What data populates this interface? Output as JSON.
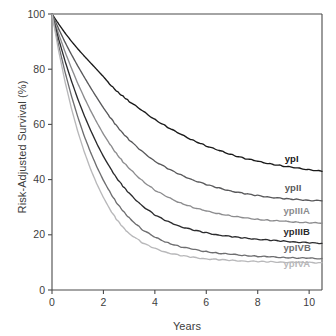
{
  "chart_data": {
    "type": "line",
    "title": "",
    "subtitle": "",
    "xlabel": "Years",
    "ylabel": "Risk-Adjusted Survival (%)",
    "xlim": [
      0,
      10.5
    ],
    "ylim": [
      0,
      100
    ],
    "xticks": [
      "0",
      "2",
      "4",
      "6",
      "8",
      "10"
    ],
    "xtick_values": [
      0,
      2,
      4,
      6,
      8,
      10
    ],
    "yticks": [
      "0",
      "20",
      "40",
      "60",
      "80",
      "100"
    ],
    "ytick_values": [
      0,
      20,
      40,
      60,
      80,
      100
    ],
    "grid": false,
    "legend_position": "inline-right-of-curve-ends",
    "x": [
      0,
      0.25,
      0.5,
      0.75,
      1,
      1.25,
      1.5,
      1.75,
      2,
      2.25,
      2.5,
      2.75,
      3,
      3.5,
      4,
      4.5,
      5,
      5.5,
      6,
      6.5,
      7,
      7.5,
      8,
      8.5,
      9,
      9.5,
      10,
      10.5
    ],
    "series": [
      {
        "name": "ypI",
        "color": "#1a1a1a",
        "label": "ypI",
        "label_x": 9.05,
        "label_y": 46.5,
        "final_value": 43,
        "values": [
          100,
          96.5,
          93.2,
          90.2,
          87.4,
          84.8,
          82.3,
          79.8,
          77.3,
          74.6,
          72.1,
          70.3,
          68.4,
          65.0,
          61.8,
          59.0,
          56.4,
          54.2,
          52.2,
          50.5,
          49.0,
          47.7,
          46.6,
          45.7,
          44.9,
          44.2,
          43.6,
          43.0
        ]
      },
      {
        "name": "ypII",
        "color": "#59595b",
        "label": "ypII",
        "label_x": 9.05,
        "label_y": 35.8,
        "final_value": 32.3,
        "values": [
          100,
          94.8,
          89.9,
          85.4,
          81.2,
          77.2,
          73.3,
          69.6,
          66.0,
          62.7,
          59.6,
          56.9,
          54.4,
          50.2,
          46.7,
          44.0,
          41.7,
          39.8,
          38.2,
          36.9,
          35.8,
          34.9,
          34.2,
          33.6,
          33.1,
          32.8,
          32.5,
          32.3
        ]
      },
      {
        "name": "ypIIIA",
        "color": "#8c8c8e",
        "label": "ypIIIA",
        "label_x": 9.0,
        "label_y": 27.6,
        "final_value": 24.2,
        "values": [
          100,
          93.0,
          86.5,
          80.5,
          74.9,
          69.8,
          65.0,
          60.6,
          56.5,
          52.8,
          49.5,
          46.6,
          44.0,
          39.7,
          36.2,
          33.6,
          31.5,
          29.9,
          28.6,
          27.6,
          26.8,
          26.1,
          25.6,
          25.2,
          24.9,
          24.6,
          24.4,
          24.2
        ]
      },
      {
        "name": "ypIIIB",
        "color": "#2b2b2d",
        "label": "ypIIIB",
        "label_x": 9.0,
        "label_y": 19.8,
        "final_value": 16.9,
        "values": [
          100,
          91.2,
          83.2,
          75.9,
          69.3,
          63.3,
          57.9,
          52.9,
          48.4,
          44.4,
          40.8,
          37.7,
          35.0,
          30.6,
          27.2,
          24.8,
          23.0,
          21.7,
          20.7,
          19.9,
          19.3,
          18.8,
          18.4,
          18.0,
          17.7,
          17.4,
          17.1,
          16.9
        ]
      },
      {
        "name": "ypIVB",
        "color": "#6e6e70",
        "label": "ypIVB",
        "label_x": 9.0,
        "label_y": 14.2,
        "final_value": 11.4,
        "values": [
          100,
          89.0,
          79.2,
          70.5,
          62.8,
          55.9,
          49.9,
          44.5,
          39.7,
          35.5,
          31.8,
          28.7,
          26.1,
          22.0,
          19.1,
          17.1,
          15.7,
          14.7,
          13.9,
          13.3,
          12.9,
          12.5,
          12.2,
          12.0,
          11.8,
          11.6,
          11.5,
          11.4
        ]
      },
      {
        "name": "ypIVA",
        "color": "#b8b8ba",
        "label": "ypIVA",
        "label_x": 9.0,
        "label_y": 8.5,
        "final_value": 9.9,
        "values": [
          100,
          87.0,
          75.8,
          66.0,
          57.5,
          50.2,
          43.8,
          38.3,
          33.5,
          29.3,
          25.7,
          22.8,
          20.5,
          17.2,
          15.0,
          13.5,
          12.5,
          11.8,
          11.3,
          11.0,
          10.7,
          10.5,
          10.3,
          10.2,
          10.1,
          10.0,
          9.95,
          9.9
        ]
      }
    ]
  },
  "axes": {
    "axis_color": "#4a4a4a",
    "tick_color": "#4a4a4a",
    "text_color": "#3d3d3d"
  }
}
